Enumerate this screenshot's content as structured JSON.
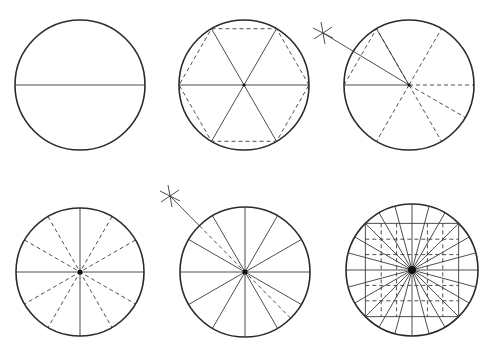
{
  "colors": {
    "background": "#ffffff",
    "stroke": "#2a2a2a",
    "construction": "#3a3a3a"
  },
  "figures": [
    {
      "id": "step-1",
      "cx": 80,
      "cy": 85,
      "r": 65,
      "description": "Circle with horizontal diameter",
      "solid_angles": [
        0
      ],
      "dashed_angles": [],
      "hexagon": false,
      "arc_mark": null,
      "grid": false
    },
    {
      "id": "step-2",
      "cx": 244,
      "cy": 85,
      "r": 65,
      "description": "Circle divided into 6 parts with inscribed dashed hexagon",
      "solid_angles": [
        0,
        60,
        120
      ],
      "dashed_angles": [],
      "hexagon": true,
      "arc_mark": null,
      "grid": false
    },
    {
      "id": "step-3",
      "cx": 409,
      "cy": 85,
      "r": 65,
      "description": "Bisecting 60-degree sector with arc mark to locate 30-degree line",
      "solid_angles": [
        180,
        240,
        210
      ],
      "dashed_angles": [
        0,
        60,
        120,
        300,
        330
      ],
      "hexagon": false,
      "arc_mark": {
        "x": 323,
        "y": 33
      },
      "chord": {
        "from_angle": 180,
        "to_angle": 240
      },
      "grid": false
    },
    {
      "id": "step-4",
      "cx": 80,
      "cy": 272,
      "r": 64,
      "description": "Circle divided into 12 parts (solid diameters, dashed 30-degree lines)",
      "solid_angles": [
        0,
        90
      ],
      "dashed_angles": [
        30,
        60,
        120,
        150
      ],
      "hexagon": false,
      "arc_mark": null,
      "grid": false
    },
    {
      "id": "step-5",
      "cx": 245,
      "cy": 272,
      "r": 65,
      "description": "Bisecting 30-degree sector with arc mark to locate 15-degree lines",
      "solid_angles": [
        0,
        30,
        60,
        90,
        120,
        150
      ],
      "dashed_angles": [
        135
      ],
      "hexagon": false,
      "arc_mark": {
        "x": 170,
        "y": 196
      },
      "grid": false
    },
    {
      "id": "step-6",
      "cx": 412,
      "cy": 270,
      "r": 66,
      "description": "Circle divided into 24 parts with inscribed square grid",
      "solid_angles": [
        0,
        15,
        30,
        45,
        60,
        75,
        90,
        105,
        120,
        135,
        150,
        165
      ],
      "dashed_angles": [],
      "hexagon": false,
      "arc_mark": null,
      "grid": true
    }
  ]
}
